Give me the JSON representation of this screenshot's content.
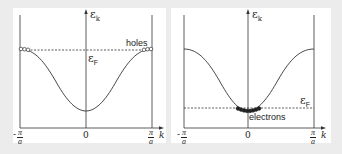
{
  "figure": {
    "background": "#ececec",
    "panel_background": "#ffffff",
    "line_color": "#333333",
    "panels": [
      {
        "id": "holes-band",
        "y_axis_label": "ε",
        "y_axis_subscript": "k",
        "x_axis_label": "k",
        "fermi_label": "ε",
        "fermi_subscript": "F",
        "carrier_label": "holes",
        "x_ticks": {
          "left_num": "π",
          "left_den": "a",
          "left_sign": "-",
          "center": "0",
          "right_num": "π",
          "right_den": "a"
        },
        "fermi_level": "near band top"
      },
      {
        "id": "electrons-band",
        "y_axis_label": "ε",
        "y_axis_subscript": "k",
        "x_axis_label": "k",
        "fermi_label": "ε",
        "fermi_subscript": "F",
        "carrier_label": "electrons",
        "x_ticks": {
          "left_num": "π",
          "left_den": "a",
          "left_sign": "-",
          "center": "0",
          "right_num": "π",
          "right_den": "a"
        },
        "fermi_level": "near band bottom"
      }
    ]
  }
}
